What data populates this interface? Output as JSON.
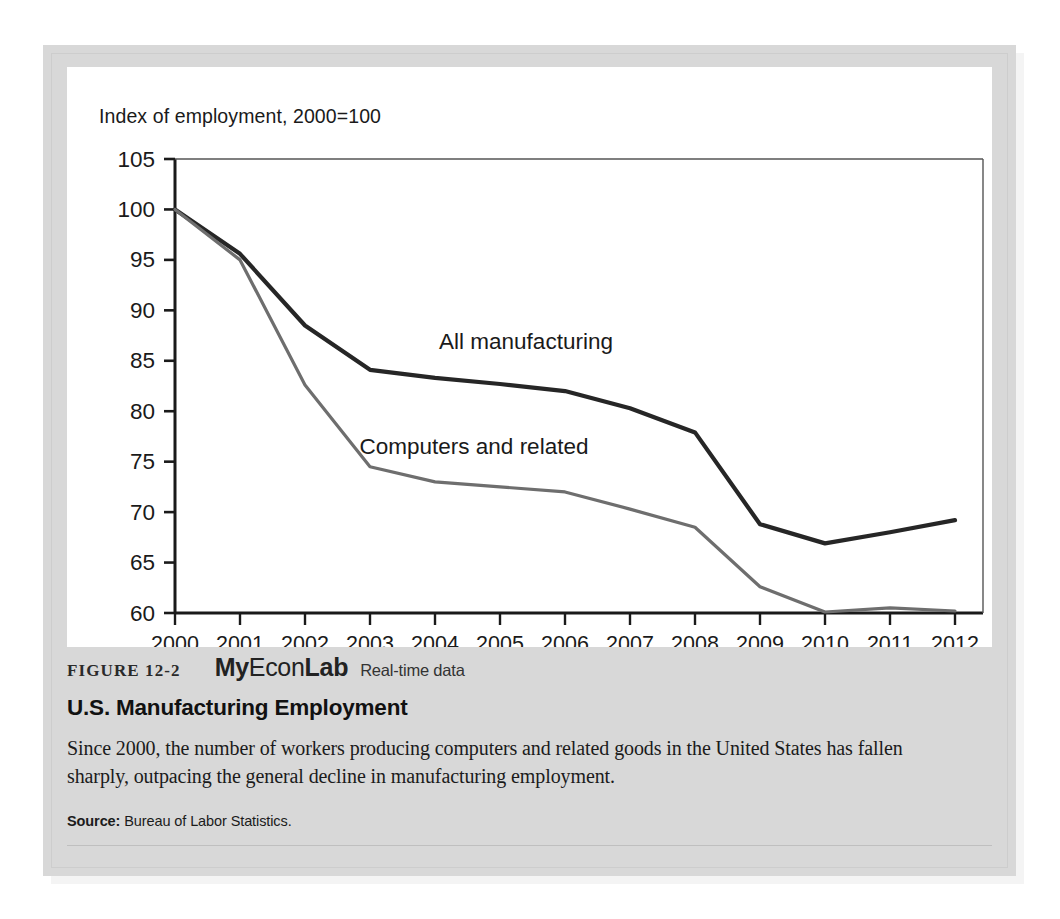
{
  "figure": {
    "number_label": "FIGURE 12-2",
    "brand_part1": "My",
    "brand_part2": "Econ",
    "brand_part3": "Lab",
    "realtime_label": "Real-time data",
    "title": "U.S. Manufacturing Employment",
    "description": "Since 2000, the number of workers producing computers and related goods in the United States has fallen sharply, outpacing the general decline in manufacturing employment.",
    "source_label": "Source:",
    "source_text": "Bureau of Labor Statistics."
  },
  "colors": {
    "panel_background": "#d8d8d8",
    "chart_background": "#ffffff",
    "series_all_manufacturing": "#262626",
    "series_computers": "#6e6e6e",
    "axis": "#1a1a1a",
    "text": "#1a1a1a"
  },
  "chart_data": {
    "type": "line",
    "title": "Index of employment, 2000=100",
    "xlabel": "",
    "ylabel": "",
    "ylim": [
      60,
      105
    ],
    "yticks": [
      60,
      65,
      70,
      75,
      80,
      85,
      90,
      95,
      100,
      105
    ],
    "grid": false,
    "legend_position": "inline-annotation",
    "x": [
      2000,
      2001,
      2002,
      2003,
      2004,
      2005,
      2006,
      2007,
      2008,
      2009,
      2010,
      2011,
      2012
    ],
    "categories": [
      "2000",
      "2001",
      "2002",
      "2003",
      "2004",
      "2005",
      "2006",
      "2007",
      "2008",
      "2009",
      "2010",
      "2011",
      "2012"
    ],
    "series": [
      {
        "name": "All manufacturing",
        "color": "#262626",
        "values": [
          100,
          95.6,
          88.5,
          84.1,
          83.3,
          82.7,
          82.0,
          80.3,
          77.9,
          68.8,
          66.9,
          68.0,
          69.2
        ]
      },
      {
        "name": "Computers and related",
        "color": "#6e6e6e",
        "values": [
          100,
          95.0,
          82.6,
          74.5,
          73.0,
          72.5,
          72.0,
          70.3,
          68.5,
          62.6,
          60.1,
          60.5,
          60.2
        ]
      }
    ],
    "annotations": [
      {
        "text": "All manufacturing",
        "x": 2005.4,
        "y": 86.2
      },
      {
        "text": "Computers and related",
        "x": 2004.6,
        "y": 75.8
      }
    ]
  }
}
